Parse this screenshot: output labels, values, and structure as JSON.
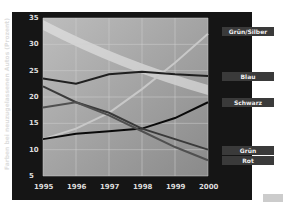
{
  "chart_data": {
    "type": "line",
    "title": "",
    "xlabel": "",
    "ylabel": "Farben bei neuzugelassenen Autos (Prozent)",
    "x": [
      "1995",
      "1996",
      "1997",
      "1998",
      "1999",
      "2000"
    ],
    "ylim": [
      5,
      35
    ],
    "yticks": [
      5,
      10,
      15,
      20,
      25,
      30,
      35
    ],
    "grid": true,
    "legend_position": "right",
    "series": [
      {
        "name": "Grün/Silber",
        "values": [
          12,
          14,
          17,
          21.5,
          26.5,
          32
        ]
      },
      {
        "name": "Blau",
        "values": [
          23.5,
          22.5,
          24.3,
          24.8,
          24.3,
          24
        ]
      },
      {
        "name": "Schwarz",
        "values": [
          12,
          13,
          13.5,
          14,
          16,
          19
        ]
      },
      {
        "name": "Grün",
        "values": [
          22,
          19,
          17,
          14,
          12,
          10
        ]
      },
      {
        "name": "Rot",
        "values": [
          18,
          19,
          16.5,
          13.5,
          10.5,
          8
        ]
      }
    ]
  },
  "axis": {
    "x_ticks": [
      "1995",
      "1996",
      "1997",
      "1998",
      "1999",
      "2000"
    ],
    "y_ticks": [
      "35",
      "30",
      "25",
      "20",
      "15",
      "10",
      "5"
    ]
  },
  "legend": [
    "Grün/Silber",
    "Blau",
    "Schwarz",
    "Grün",
    "Rot"
  ]
}
